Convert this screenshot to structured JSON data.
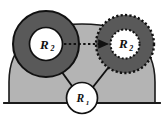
{
  "figure": {
    "background_color": "#ffffff",
    "terrain": {
      "name": "ground-mound",
      "fill_color": "#b4b4b4",
      "stroke_color": "#1a1a1a",
      "baseline_label": ""
    },
    "nodes": [
      {
        "id": "r2-start",
        "label_main": "R",
        "label_sub": "2",
        "state": "current",
        "outline_style": "solid",
        "ring_color": "#595959",
        "core_color": "#ffffff",
        "stroke_color": "#111111",
        "cx": 46,
        "cy": 44,
        "r_outer": 34,
        "r_inner": 17
      },
      {
        "id": "r2-target",
        "label_main": "R",
        "label_sub": "2",
        "state": "target",
        "outline_style": "dotted",
        "ring_color": "#595959",
        "core_color": "#ffffff",
        "stroke_color": "#111111",
        "cx": 125,
        "cy": 44,
        "r_outer": 30,
        "r_inner": 15
      },
      {
        "id": "r1",
        "label_main": "R",
        "label_sub": "1",
        "state": "current",
        "outline_style": "solid",
        "ring_color": "#ffffff",
        "core_color": "#ffffff",
        "stroke_color": "#111111",
        "cx": 82,
        "cy": 98,
        "r_outer": 16,
        "r_inner": 16
      }
    ],
    "arrows": [
      {
        "id": "arrow-r2-move",
        "from": "r2-start",
        "to": "r2-target",
        "style": "dotted",
        "color": "#111111",
        "label": ""
      },
      {
        "id": "arrow-r1-to-r2-start",
        "from": "r1",
        "to": "r2-start",
        "style": "solid",
        "color": "#111111",
        "label": ""
      },
      {
        "id": "arrow-r1-to-r2-target",
        "from": "r1",
        "to": "r2-target",
        "style": "solid",
        "color": "#111111",
        "label": ""
      }
    ]
  }
}
